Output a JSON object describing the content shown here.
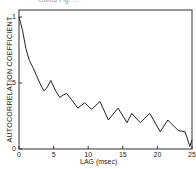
{
  "chart_data": {
    "type": "line",
    "title": "Gurus Fig. ...",
    "xlabel": "LAG (msec)",
    "ylabel": "AUTOCORRELATION COEFFICIENT",
    "xlim": [
      0,
      25
    ],
    "ylim": [
      0,
      1
    ],
    "xticks": [
      "0",
      "5",
      "10",
      "15",
      "20",
      "25"
    ],
    "yticks": [
      "0",
      ".5",
      "1"
    ],
    "grid": false,
    "series": [
      {
        "name": "autocorrelation",
        "x": [
          0,
          0.5,
          1,
          1.5,
          2,
          2.5,
          3,
          3.6,
          4.1,
          4.6,
          5.2,
          5.9,
          6.4,
          6.9,
          7.5,
          8.5,
          9.5,
          10.5,
          11.7,
          12.9,
          14.3,
          15.6,
          16.3,
          17.5,
          18.9,
          20.4,
          21.5,
          23.0,
          24.0,
          24.7,
          25
        ],
        "values": [
          1.0,
          0.9,
          0.76,
          0.67,
          0.62,
          0.56,
          0.5,
          0.44,
          0.47,
          0.52,
          0.45,
          0.39,
          0.41,
          0.42,
          0.38,
          0.31,
          0.35,
          0.3,
          0.36,
          0.22,
          0.31,
          0.2,
          0.27,
          0.2,
          0.27,
          0.13,
          0.22,
          0.14,
          0.13,
          0.02,
          0.07
        ]
      }
    ]
  },
  "labels": {
    "title": "Gurus Fig. ...",
    "xlabel": "LAG (msec)",
    "ylabel": "AUTOCORRELATION COEFFICIENT"
  }
}
